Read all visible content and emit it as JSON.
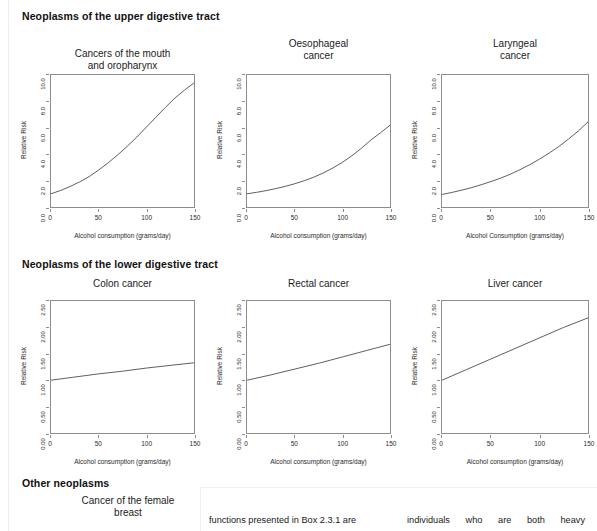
{
  "sections": [
    {
      "id": "upper",
      "heading": "Neoplasms of the upper digestive tract"
    },
    {
      "id": "lower",
      "heading": "Neoplasms of the lower digestive tract"
    },
    {
      "id": "other",
      "heading": "Other neoplasms"
    }
  ],
  "axis": {
    "ylabel": "Relative Risk",
    "xlabel_lower": "Alcohol consumption (grams/day)",
    "xlabel_upper": "Alcohol Consumption (grams/day)",
    "xticks": [
      "0",
      "50",
      "100",
      "150"
    ],
    "yticks_high": [
      "0.0",
      "2.0",
      "4.0",
      "6.0",
      "8.0",
      "10.0"
    ],
    "yticks_low": [
      "0.00",
      "0.50",
      "1.00",
      "1.50",
      "2.00",
      "2.50"
    ]
  },
  "pending_panel": {
    "title_line1": "Cancer of the female",
    "title_line2": "breast"
  },
  "body_text": {
    "left_column": "functions presented in Box 2.3.1 are",
    "right_column": "individuals  who  are  both  heavy"
  },
  "chart_data": [
    {
      "type": "line",
      "id": "mouth-oropharynx",
      "title": "Cancers of the mouth and oropharynx",
      "title_line1": "Cancers of the mouth",
      "title_line2": "and oropharynx",
      "xlabel": "Alcohol consumption (grams/day)",
      "ylabel": "Relative Risk",
      "xlim": [
        0,
        150
      ],
      "ylim": [
        0.0,
        10.0
      ],
      "xticks": [
        0,
        50,
        100,
        150
      ],
      "yticks": [
        0.0,
        2.0,
        4.0,
        6.0,
        8.0,
        10.0
      ],
      "grid": false,
      "legend": "none",
      "x": [
        0,
        10,
        20,
        30,
        40,
        50,
        60,
        70,
        80,
        90,
        100,
        110,
        120,
        130,
        140,
        150
      ],
      "y": [
        1.0,
        1.25,
        1.55,
        1.9,
        2.3,
        2.8,
        3.35,
        3.95,
        4.6,
        5.3,
        6.05,
        6.8,
        7.55,
        8.25,
        8.85,
        9.4
      ]
    },
    {
      "type": "line",
      "id": "oesophageal",
      "title": "Oesophageal cancer",
      "title_line1": "Oesophageal",
      "title_line2": "cancer",
      "xlabel": "Alcohol consumption (grams/day)",
      "ylabel": "Relative Risk",
      "xlim": [
        0,
        150
      ],
      "ylim": [
        0.0,
        10.0
      ],
      "xticks": [
        0,
        50,
        100,
        150
      ],
      "yticks": [
        0.0,
        2.0,
        4.0,
        6.0,
        8.0,
        10.0
      ],
      "grid": false,
      "legend": "none",
      "x": [
        0,
        10,
        20,
        30,
        40,
        50,
        60,
        70,
        80,
        90,
        100,
        110,
        120,
        130,
        140,
        150
      ],
      "y": [
        1.0,
        1.11,
        1.24,
        1.39,
        1.56,
        1.76,
        1.99,
        2.26,
        2.58,
        2.95,
        3.38,
        3.88,
        4.45,
        5.08,
        5.62,
        6.2
      ]
    },
    {
      "type": "line",
      "id": "laryngeal",
      "title": "Laryngeal cancer",
      "title_line1": "Laryngeal",
      "title_line2": "cancer",
      "xlabel": "Alcohol Consumption (grams/day)",
      "ylabel": "Relative Risk",
      "xlim": [
        0,
        150
      ],
      "ylim": [
        0.0,
        10.0
      ],
      "xticks": [
        0,
        50,
        100,
        150
      ],
      "yticks": [
        0.0,
        2.0,
        4.0,
        6.0,
        8.0,
        10.0
      ],
      "grid": false,
      "legend": "none",
      "x": [
        0,
        10,
        20,
        30,
        40,
        50,
        60,
        70,
        80,
        90,
        100,
        110,
        120,
        130,
        140,
        150
      ],
      "y": [
        0.95,
        1.1,
        1.27,
        1.46,
        1.68,
        1.92,
        2.18,
        2.48,
        2.82,
        3.2,
        3.62,
        4.08,
        4.58,
        5.15,
        5.75,
        6.45
      ]
    },
    {
      "type": "line",
      "id": "colon",
      "title": "Colon cancer",
      "title_line1": "Colon cancer",
      "title_line2": "",
      "xlabel": "Alcohol consumption (grams/day)",
      "ylabel": "Relative Risk",
      "xlim": [
        0,
        150
      ],
      "ylim": [
        0.0,
        2.5
      ],
      "xticks": [
        0,
        50,
        100,
        150
      ],
      "yticks": [
        0.0,
        0.5,
        1.0,
        1.5,
        2.0,
        2.5
      ],
      "grid": false,
      "legend": "none",
      "x": [
        0,
        25,
        50,
        75,
        100,
        125,
        150
      ],
      "y": [
        1.0,
        1.06,
        1.12,
        1.17,
        1.23,
        1.28,
        1.33
      ]
    },
    {
      "type": "line",
      "id": "rectal",
      "title": "Rectal cancer",
      "title_line1": "Rectal cancer",
      "title_line2": "",
      "xlabel": "Alcohol consumption (grams/day)",
      "ylabel": "Relative Risk",
      "xlim": [
        0,
        150
      ],
      "ylim": [
        0.0,
        2.5
      ],
      "xticks": [
        0,
        50,
        100,
        150
      ],
      "yticks": [
        0.0,
        0.5,
        1.0,
        1.5,
        2.0,
        2.5
      ],
      "grid": false,
      "legend": "none",
      "x": [
        0,
        25,
        50,
        75,
        100,
        125,
        150
      ],
      "y": [
        1.0,
        1.1,
        1.21,
        1.32,
        1.44,
        1.56,
        1.68
      ]
    },
    {
      "type": "line",
      "id": "liver",
      "title": "Liver cancer",
      "title_line1": "Liver cancer",
      "title_line2": "",
      "xlabel": "Alcohol consumption (grams/day)",
      "ylabel": "Relative Risk",
      "xlim": [
        0,
        150
      ],
      "ylim": [
        0.0,
        2.5
      ],
      "xticks": [
        0,
        50,
        100,
        150
      ],
      "yticks": [
        0.0,
        0.5,
        1.0,
        1.5,
        2.0,
        2.5
      ],
      "grid": false,
      "legend": "none",
      "x": [
        0,
        25,
        50,
        75,
        100,
        125,
        150
      ],
      "y": [
        1.0,
        1.2,
        1.4,
        1.6,
        1.8,
        2.0,
        2.18
      ]
    }
  ]
}
